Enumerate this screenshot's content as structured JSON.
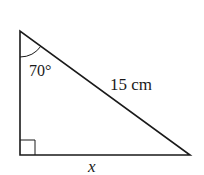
{
  "diagram": {
    "type": "right-triangle",
    "vertices": {
      "top": [
        20,
        31
      ],
      "right_angle": [
        20,
        155
      ],
      "bottom_right": [
        190,
        155
      ]
    },
    "angle_label": "70°",
    "hypotenuse_label": "15 cm",
    "base_label": "x",
    "right_angle_marker": true,
    "stroke_color": "#1a1a1a"
  }
}
